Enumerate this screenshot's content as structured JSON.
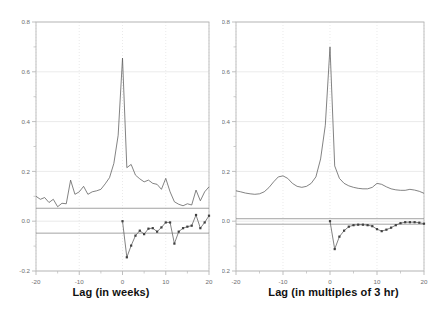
{
  "figure": {
    "background_color": "#ffffff",
    "axis_color": "#b8b8b8",
    "grid_color": "#dcdcdc",
    "series_color": "#5a5a5a",
    "band_color": "#8c8c8c",
    "text_color": "#6e6e6e",
    "title_color": "#111111"
  },
  "chart_data": [
    {
      "type": "line",
      "panel": "left",
      "name": "autocorrelation-weekly",
      "title": "",
      "xlabel": "Lag (in weeks)",
      "ylabel": "",
      "xlim": [
        -20,
        20
      ],
      "ylim": [
        -0.2,
        0.8
      ],
      "xticks": [
        -20,
        -10,
        0,
        10,
        20
      ],
      "xticklabels": [
        "-20",
        "-10",
        "0",
        "10",
        "20"
      ],
      "yticks": [
        -0.2,
        0.0,
        0.2,
        0.4,
        0.6,
        0.8
      ],
      "yticklabels": [
        "-0.2",
        "0.0",
        "0.2",
        "0.4",
        "0.6",
        "0.8"
      ],
      "xminorticks": [
        -15,
        -5,
        5,
        15
      ],
      "grid": true,
      "legend": "none",
      "confidence_bounds": [
        -0.048,
        0.052
      ],
      "series": [
        {
          "name": "acf",
          "style": "line",
          "marker": "none",
          "x": [
            -20,
            -19,
            -18,
            -17,
            -16,
            -15,
            -14,
            -13,
            -12,
            -11,
            -10,
            -9,
            -8,
            -7,
            -6,
            -5,
            -4,
            -3,
            -2,
            -1,
            0,
            1,
            2,
            3,
            4,
            5,
            6,
            7,
            8,
            9,
            10,
            11,
            12,
            13,
            14,
            15,
            16,
            17,
            18,
            19,
            20
          ],
          "values": [
            0.1,
            0.088,
            0.095,
            0.075,
            0.088,
            0.058,
            0.072,
            0.07,
            0.165,
            0.108,
            0.118,
            0.14,
            0.108,
            0.118,
            0.122,
            0.128,
            0.15,
            0.175,
            0.232,
            0.345,
            0.655,
            0.215,
            0.228,
            0.185,
            0.17,
            0.158,
            0.165,
            0.152,
            0.148,
            0.128,
            0.172,
            0.118,
            0.078,
            0.068,
            0.062,
            0.07,
            0.065,
            0.125,
            0.082,
            0.118,
            0.138
          ]
        },
        {
          "name": "pacf-residual",
          "style": "line-marker",
          "marker": "dot",
          "x": [
            0,
            1,
            2,
            3,
            4,
            5,
            6,
            7,
            8,
            9,
            10,
            11,
            12,
            13,
            14,
            15,
            16,
            17,
            18,
            19,
            20
          ],
          "values": [
            0.0,
            -0.145,
            -0.098,
            -0.058,
            -0.038,
            -0.052,
            -0.03,
            -0.028,
            -0.042,
            -0.025,
            -0.005,
            -0.005,
            -0.09,
            -0.042,
            -0.028,
            -0.022,
            -0.018,
            0.025,
            -0.028,
            -0.005,
            0.022
          ]
        }
      ]
    },
    {
      "type": "line",
      "panel": "right",
      "name": "autocorrelation-3hr",
      "title": "",
      "xlabel": "Lag (in multiples of 3 hr)",
      "ylabel": "",
      "xlim": [
        -20,
        20
      ],
      "ylim": [
        -0.2,
        0.8
      ],
      "xticks": [
        -20,
        -10,
        0,
        10,
        20
      ],
      "xticklabels": [
        "-20",
        "-10",
        "0",
        "10",
        "20"
      ],
      "yticks": [
        -0.2,
        0.0,
        0.2,
        0.4,
        0.6,
        0.8
      ],
      "yticklabels": [
        "-0.2",
        "0.0",
        "0.2",
        "0.4",
        "0.6",
        "0.8"
      ],
      "xminorticks": [
        -15,
        -5,
        5,
        15
      ],
      "grid": true,
      "legend": "none",
      "confidence_bounds": [
        -0.012,
        0.01
      ],
      "series": [
        {
          "name": "acf",
          "style": "line",
          "marker": "none",
          "x": [
            -20,
            -19,
            -18,
            -17,
            -16,
            -15,
            -14,
            -13,
            -12,
            -11,
            -10,
            -9,
            -8,
            -7,
            -6,
            -5,
            -4,
            -3,
            -2,
            -1,
            0,
            1,
            2,
            3,
            4,
            5,
            6,
            7,
            8,
            9,
            10,
            11,
            12,
            13,
            14,
            15,
            16,
            17,
            18,
            19,
            20
          ],
          "values": [
            0.122,
            0.118,
            0.113,
            0.11,
            0.108,
            0.11,
            0.118,
            0.135,
            0.158,
            0.178,
            0.182,
            0.172,
            0.152,
            0.14,
            0.136,
            0.14,
            0.152,
            0.178,
            0.25,
            0.385,
            0.7,
            0.222,
            0.172,
            0.152,
            0.142,
            0.136,
            0.132,
            0.13,
            0.13,
            0.136,
            0.152,
            0.148,
            0.138,
            0.13,
            0.126,
            0.124,
            0.124,
            0.128,
            0.125,
            0.12,
            0.112
          ]
        },
        {
          "name": "pacf-residual",
          "style": "line-marker",
          "marker": "dot",
          "x": [
            0,
            1,
            2,
            3,
            4,
            5,
            6,
            7,
            8,
            9,
            10,
            11,
            12,
            13,
            14,
            15,
            16,
            17,
            18,
            19,
            20
          ],
          "values": [
            0.0,
            -0.112,
            -0.062,
            -0.038,
            -0.022,
            -0.016,
            -0.014,
            -0.014,
            -0.016,
            -0.02,
            -0.032,
            -0.04,
            -0.034,
            -0.026,
            -0.016,
            -0.008,
            -0.004,
            -0.004,
            -0.004,
            -0.006,
            -0.01
          ]
        }
      ]
    }
  ]
}
